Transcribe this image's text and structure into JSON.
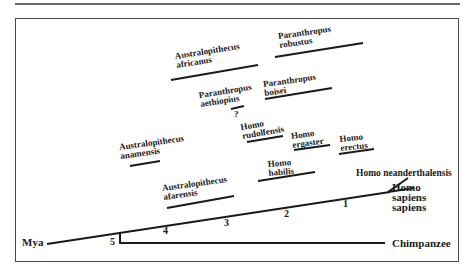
{
  "figure": {
    "axis_label": "Mya",
    "time_markers": [
      "5",
      "4",
      "3",
      "2",
      "1"
    ],
    "outgroup": "Chimpanzee",
    "modern": {
      "line1": "Homo",
      "line2": "sapiens",
      "line3": "sapiens"
    },
    "neanderthal": "Homo neanderthalensis",
    "question_mark": "?",
    "species": [
      {
        "genus": "Australopithecus",
        "species": "africanus"
      },
      {
        "genus": "Paranthropus",
        "species": "robustus"
      },
      {
        "genus": "Paranthropus",
        "species": "aethiopius"
      },
      {
        "genus": "Paranthropus",
        "species": "boisei"
      },
      {
        "genus": "Homo",
        "species": "rudolfensis"
      },
      {
        "genus": "Homo",
        "species": "ergaster"
      },
      {
        "genus": "Homo",
        "species": "erectus"
      },
      {
        "genus": "Australopithecus",
        "species": "anamensis"
      },
      {
        "genus": "Homo",
        "species": "habilis"
      },
      {
        "genus": "Australopithecus",
        "species": "afarensis"
      }
    ]
  }
}
